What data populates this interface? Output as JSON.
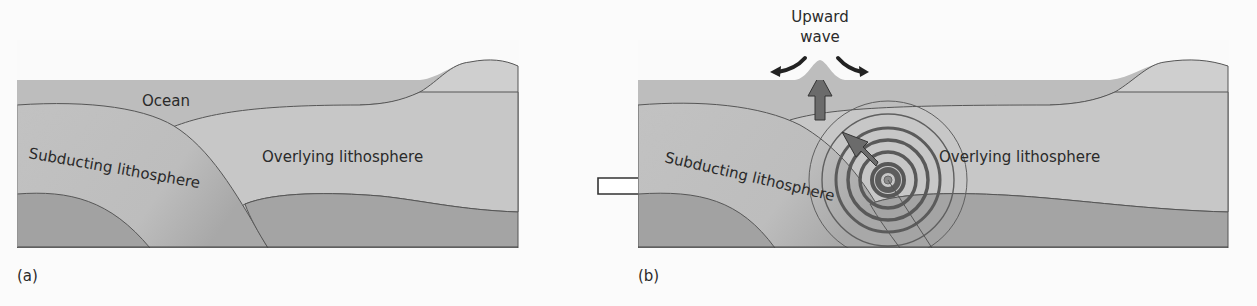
{
  "figure": {
    "panels": [
      {
        "id": "a",
        "caption": "(a)",
        "labels": {
          "ocean": "Ocean",
          "subducting": "Subducting lithosphere",
          "overlying": "Overlying lithosphere"
        }
      },
      {
        "id": "b",
        "caption": "(b)",
        "labels": {
          "wave_line1": "Upward",
          "wave_line2": "wave",
          "subducting": "Subducting lithosphere",
          "overlying": "Overlying lithosphere"
        }
      }
    ],
    "transition_arrow": "hollow-right-arrow",
    "colors": {
      "ocean": "#b9b9b9",
      "lithosphere": "#c4c4c4",
      "mantle": "#9e9e9e",
      "land": "#cfcfcf",
      "outline": "#4a4a4a",
      "arrow": "#6a6a6a",
      "rings": "#5e5e5e"
    }
  }
}
